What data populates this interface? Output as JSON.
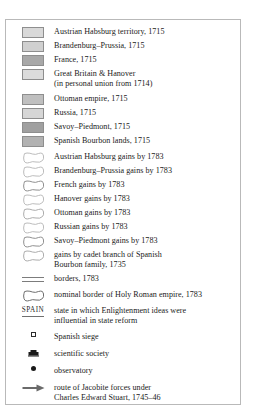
{
  "legend": {
    "name": "map-legend",
    "colors": {
      "austria_1715": "#d9d9d9",
      "brandenburg_1715": "#d0d0d0",
      "france_1715": "#a8a8a8",
      "britain_hanover_1715": "#dcdcdc",
      "ottoman_1715": "#bfbfbf",
      "russia_1715": "#d6d6d6",
      "savoy_1715": "#a0a0a0",
      "spanish_bourbon_1715": "#b2b2b2",
      "outline_stroke": "#9a9a9a",
      "outline_stroke_dark": "#6e6e6e",
      "frame": "#b9b9b9",
      "text": "#1a1a1a"
    },
    "entries": [
      {
        "id": "austrian-habsburg-territory-1715",
        "symbol": "filled-swatch",
        "fill": "#d9d9d9",
        "line1": "Austrian Habsburg territory, 1715",
        "line2": ""
      },
      {
        "id": "brandenburg-prussia-1715",
        "symbol": "filled-swatch",
        "fill": "#d0d0d0",
        "line1": "Brandenburg–Prussia, 1715",
        "line2": ""
      },
      {
        "id": "france-1715",
        "symbol": "filled-swatch",
        "fill": "#a8a8a8",
        "line1": "France, 1715",
        "line2": ""
      },
      {
        "id": "great-britain-hanover-1715",
        "symbol": "filled-swatch",
        "fill": "#dcdcdc",
        "line1": "Great Britain & Hanover",
        "line2": "(in personal union from 1714)"
      },
      {
        "id": "ottoman-empire-1715",
        "symbol": "filled-swatch",
        "fill": "#bfbfbf",
        "line1": "Ottoman empire, 1715",
        "line2": ""
      },
      {
        "id": "russia-1715",
        "symbol": "filled-swatch",
        "fill": "#d6d6d6",
        "line1": "Russia, 1715",
        "line2": ""
      },
      {
        "id": "savoy-piedmont-1715",
        "symbol": "filled-swatch",
        "fill": "#a0a0a0",
        "line1": "Savoy–Piedmont, 1715",
        "line2": ""
      },
      {
        "id": "spanish-bourbon-lands-1715",
        "symbol": "filled-swatch",
        "fill": "#b2b2b2",
        "line1": "Spanish Bourbon lands, 1715",
        "line2": ""
      },
      {
        "id": "austrian-habsburg-gains-1783",
        "symbol": "outline-blob",
        "stroke": "#b0b0b0",
        "line1": "Austrian Habsburg gains by 1783",
        "line2": ""
      },
      {
        "id": "brandenburg-prussia-gains-1783",
        "symbol": "outline-blob",
        "stroke": "#b0b0b0",
        "line1": "Brandenburg–Prussia gains by 1783",
        "line2": ""
      },
      {
        "id": "french-gains-1783",
        "symbol": "outline-blob",
        "stroke": "#8a8a8a",
        "line1": "French gains by 1783",
        "line2": ""
      },
      {
        "id": "hanover-gains-1783",
        "symbol": "outline-blob",
        "stroke": "#b0b0b0",
        "line1": "Hanover gains by 1783",
        "line2": ""
      },
      {
        "id": "ottoman-gains-1783",
        "symbol": "outline-blob",
        "stroke": "#a3a3a3",
        "line1": "Ottoman gains by 1783",
        "line2": ""
      },
      {
        "id": "russian-gains-1783",
        "symbol": "outline-blob",
        "stroke": "#b0b0b0",
        "line1": "Russian gains by 1783",
        "line2": ""
      },
      {
        "id": "savoy-piedmont-gains-1783",
        "symbol": "outline-blob",
        "stroke": "#8a8a8a",
        "line1": "Savoy–Piedmont gains by 1783",
        "line2": ""
      },
      {
        "id": "cadet-branch-spanish-bourbon-gains-1735",
        "symbol": "outline-blob",
        "stroke": "#a3a3a3",
        "line1": "gains by cadet branch of Spanish",
        "line2": "Bourbon family, 1735"
      },
      {
        "id": "borders-1783",
        "symbol": "double-line",
        "stroke": "#7c7c7c",
        "line1": "borders, 1783",
        "line2": ""
      },
      {
        "id": "nominal-border-holy-roman-empire-1783",
        "symbol": "outline-blob",
        "stroke": "#6e6e6e",
        "line1": "nominal border of Holy Roman empire, 1783",
        "line2": ""
      },
      {
        "id": "enlightenment-state-reform",
        "symbol": "spain-label",
        "symbol_text": "SPAIN",
        "line1": "state in which Enlightenment ideas were",
        "line2": "influential in state reform"
      },
      {
        "id": "spanish-siege",
        "symbol": "siege-square",
        "line1": "Spanish siege",
        "line2": ""
      },
      {
        "id": "scientific-society",
        "symbol": "society-building",
        "line1": "scientific society",
        "line2": ""
      },
      {
        "id": "observatory",
        "symbol": "observatory-dot",
        "line1": "observatory",
        "line2": ""
      },
      {
        "id": "jacobite-route",
        "symbol": "arrow-right",
        "line1": "route of Jacobite forces under",
        "line2": "Charles Edward Stuart, 1745–46"
      }
    ]
  }
}
